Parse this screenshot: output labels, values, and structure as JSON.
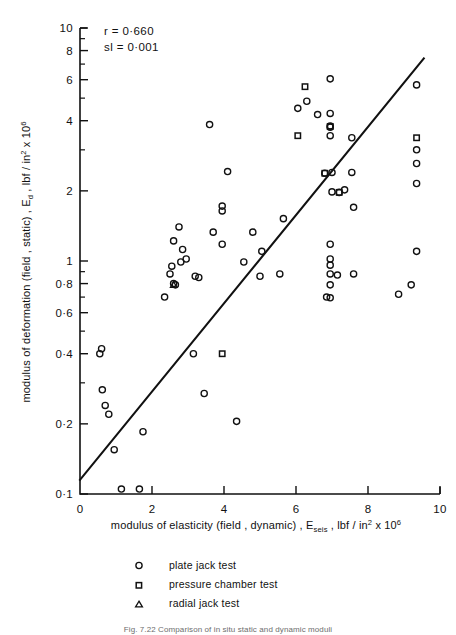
{
  "figure": {
    "caption": "Fig. 7.22  Comparison of in situ static and dynamic moduli"
  },
  "annotations": {
    "correlation": "r = 0·660",
    "significance": "sl = 0·001"
  },
  "legend": {
    "items": [
      {
        "marker": "circle-marker",
        "label": "plate jack test"
      },
      {
        "marker": "square-marker",
        "label": "pressure chamber test"
      },
      {
        "marker": "triangle-marker",
        "label": "radial jack test"
      }
    ]
  },
  "axes": {
    "x": {
      "label_parts": {
        "main": "modulus of elasticity (field , dynamic) ,  E",
        "sub": "seis",
        "mid": " , lbf / in",
        "sup": "2",
        "tail": " x 10",
        "sup2": "6"
      },
      "ticks": [
        "0",
        "2",
        "4",
        "6",
        "8",
        "10"
      ],
      "tick_values": [
        0,
        2,
        4,
        6,
        8,
        10
      ],
      "range": [
        0,
        10
      ],
      "scale": "linear"
    },
    "y": {
      "label_parts": {
        "main": "modulus of deformation (field , static) ,  E",
        "sub": "d",
        "mid": " , lbf / in",
        "sup": "2",
        "tail": " x 10",
        "sup2": "6"
      },
      "ticks": [
        "10",
        "8",
        "6",
        "4",
        "2",
        "1",
        "0·8",
        "0·6",
        "0·4",
        "0·2",
        "0·1"
      ],
      "tick_values": [
        10,
        8,
        6,
        4,
        2,
        1,
        0.8,
        0.6,
        0.4,
        0.2,
        0.1
      ],
      "minor_ticks": [
        9,
        7,
        5,
        3,
        0.9,
        0.7,
        0.5,
        0.3
      ],
      "range": [
        0.1,
        10
      ],
      "scale": "log"
    }
  },
  "chart_data": {
    "type": "scatter",
    "title": "",
    "xlabel": "modulus of elasticity (field, dynamic), E_seis, lbf/in^2 x 10^6",
    "ylabel": "modulus of deformation (field, static), E_d, lbf/in^2 x 10^6",
    "xlim": [
      0,
      10
    ],
    "ylim": [
      0.1,
      10
    ],
    "xscale": "linear",
    "yscale": "log",
    "grid": false,
    "legend_position": "below-plot",
    "annotations": {
      "r": 0.66,
      "sl": 0.001
    },
    "trendline": {
      "type": "linear-on-loglinear",
      "p0": [
        0.0,
        0.115
      ],
      "p1": [
        9.55,
        7.4
      ]
    },
    "series": [
      {
        "name": "plate jack test",
        "marker": "circle",
        "points": [
          [
            0.55,
            0.4
          ],
          [
            0.6,
            0.42
          ],
          [
            0.62,
            0.28
          ],
          [
            0.7,
            0.24
          ],
          [
            0.8,
            0.22
          ],
          [
            0.95,
            0.155
          ],
          [
            1.15,
            0.105
          ],
          [
            1.65,
            0.105
          ],
          [
            1.75,
            0.185
          ],
          [
            2.35,
            0.7
          ],
          [
            2.5,
            0.88
          ],
          [
            2.55,
            0.95
          ],
          [
            2.6,
            0.8
          ],
          [
            2.65,
            0.79
          ],
          [
            2.6,
            1.22
          ],
          [
            2.75,
            1.4
          ],
          [
            2.85,
            1.12
          ],
          [
            2.8,
            0.99
          ],
          [
            2.95,
            1.02
          ],
          [
            3.15,
            0.4
          ],
          [
            3.2,
            0.86
          ],
          [
            3.3,
            0.85
          ],
          [
            3.45,
            0.27
          ],
          [
            3.6,
            3.85
          ],
          [
            3.7,
            1.33
          ],
          [
            3.95,
            1.72
          ],
          [
            3.95,
            1.64
          ],
          [
            3.95,
            1.18
          ],
          [
            4.1,
            2.42
          ],
          [
            4.35,
            0.205
          ],
          [
            4.55,
            0.99
          ],
          [
            4.8,
            1.33
          ],
          [
            5.0,
            0.86
          ],
          [
            5.05,
            1.1
          ],
          [
            5.55,
            0.88
          ],
          [
            5.65,
            1.52
          ],
          [
            6.05,
            4.52
          ],
          [
            6.3,
            4.85
          ],
          [
            6.6,
            4.25
          ],
          [
            6.95,
            6.05
          ],
          [
            6.95,
            4.3
          ],
          [
            6.95,
            3.8
          ],
          [
            6.95,
            3.75
          ],
          [
            6.95,
            3.45
          ],
          [
            6.8,
            2.38
          ],
          [
            7.0,
            2.4
          ],
          [
            7.0,
            1.98
          ],
          [
            7.2,
            1.97
          ],
          [
            7.35,
            2.02
          ],
          [
            7.55,
            2.4
          ],
          [
            7.6,
            1.7
          ],
          [
            6.95,
            1.18
          ],
          [
            6.95,
            1.02
          ],
          [
            6.95,
            0.96
          ],
          [
            6.95,
            0.88
          ],
          [
            7.15,
            0.87
          ],
          [
            7.6,
            0.88
          ],
          [
            6.95,
            0.79
          ],
          [
            6.85,
            0.7
          ],
          [
            6.95,
            0.695
          ],
          [
            7.55,
            3.38
          ],
          [
            9.35,
            5.7
          ],
          [
            9.35,
            3.0
          ],
          [
            9.35,
            2.62
          ],
          [
            9.35,
            2.15
          ],
          [
            9.35,
            1.1
          ],
          [
            9.2,
            0.79
          ],
          [
            8.85,
            0.72
          ]
        ]
      },
      {
        "name": "pressure chamber test",
        "marker": "square",
        "points": [
          [
            3.95,
            0.4
          ],
          [
            6.25,
            5.6
          ],
          [
            6.05,
            3.45
          ],
          [
            6.95,
            3.78
          ],
          [
            6.8,
            2.38
          ],
          [
            7.2,
            1.97
          ],
          [
            9.35,
            3.38
          ]
        ]
      },
      {
        "name": "radial jack test",
        "marker": "triangle",
        "points": [
          [
            2.6,
            0.79
          ]
        ]
      }
    ]
  }
}
